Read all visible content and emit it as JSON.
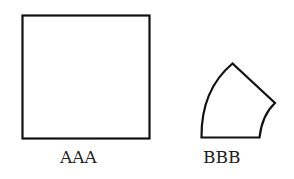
{
  "figure": {
    "shapes": [
      {
        "id": "square",
        "label": "AAA",
        "type": "square"
      },
      {
        "id": "curved-wedge",
        "label": "BBB",
        "type": "annular-sector"
      }
    ],
    "stroke_color": "#111111",
    "background": "#ffffff"
  }
}
